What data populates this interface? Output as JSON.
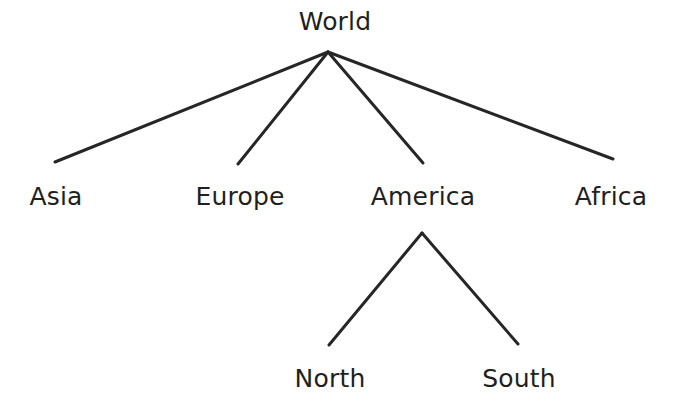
{
  "diagram": {
    "type": "tree",
    "background_color": "#ffffff",
    "line_color": "#262626",
    "text_color": "#231f20",
    "line_width": 3,
    "nodes": [
      {
        "id": "world",
        "label": "World",
        "level": 0,
        "x": 335,
        "y": 21
      },
      {
        "id": "asia",
        "label": "Asia",
        "level": 1,
        "x": 56,
        "y": 196
      },
      {
        "id": "europe",
        "label": "Europe",
        "level": 1,
        "x": 240,
        "y": 196
      },
      {
        "id": "america",
        "label": "America",
        "level": 1,
        "x": 423,
        "y": 196
      },
      {
        "id": "africa",
        "label": "Africa",
        "level": 1,
        "x": 611,
        "y": 196
      },
      {
        "id": "north",
        "label": "North",
        "level": 2,
        "x": 330,
        "y": 378
      },
      {
        "id": "south",
        "label": "South",
        "level": 2,
        "x": 519,
        "y": 378
      }
    ],
    "edges": [
      {
        "id": "world-asia",
        "from": "world",
        "to": "asia",
        "x1": 328,
        "y1": 52,
        "x2": 55,
        "y2": 162
      },
      {
        "id": "world-europe",
        "from": "world",
        "to": "europe",
        "x1": 328,
        "y1": 52,
        "x2": 238,
        "y2": 164
      },
      {
        "id": "world-america",
        "from": "world",
        "to": "america",
        "x1": 328,
        "y1": 52,
        "x2": 423,
        "y2": 163
      },
      {
        "id": "world-africa",
        "from": "world",
        "to": "africa",
        "x1": 328,
        "y1": 52,
        "x2": 613,
        "y2": 159
      },
      {
        "id": "america-north",
        "from": "america",
        "to": "north",
        "x1": 422,
        "y1": 233,
        "x2": 329,
        "y2": 345
      },
      {
        "id": "america-south",
        "from": "america",
        "to": "south",
        "x1": 422,
        "y1": 233,
        "x2": 518,
        "y2": 344
      }
    ]
  }
}
